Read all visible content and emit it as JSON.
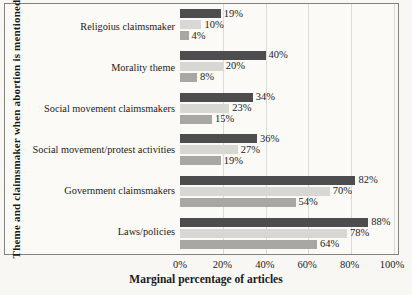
{
  "figure": {
    "background": "#f9f7f3",
    "plot_background": "#fbfaf7",
    "border_color": "#83827f",
    "gridline_color": "#dbdbd8",
    "text_color": "#1b1b1b"
  },
  "chart_data": {
    "type": "bar",
    "orientation": "horizontal",
    "title": "",
    "xlabel": "Marginal percentage of articles",
    "ylabel": "Theme and claimsmaker when abortion is mentioned",
    "xlim": [
      0,
      100
    ],
    "xticks": [
      "0%",
      "20%",
      "40%",
      "60%",
      "80%",
      "100%"
    ],
    "grid": "vertical-only",
    "legend": "none",
    "data_labels": "outside-end",
    "categories": [
      "Religoius claimsmaker",
      "Morality theme",
      "Social movement claimsmakers",
      "Social movement/protest activities",
      "Government claimsmakers",
      "Laws/policies"
    ],
    "series": [
      {
        "name": "dark-gray",
        "color": "#4d4d4f",
        "values": [
          19,
          40,
          34,
          36,
          82,
          88
        ],
        "labels": [
          "19%",
          "40%",
          "34%",
          "36%",
          "82%",
          "88%"
        ]
      },
      {
        "name": "light-gray",
        "color": "#d8d7d3",
        "values": [
          10,
          20,
          23,
          27,
          70,
          78
        ],
        "labels": [
          "10%",
          "20%",
          "23%",
          "27%",
          "70%",
          "78%"
        ]
      },
      {
        "name": "medium-gray",
        "color": "#a8a7a4",
        "values": [
          4,
          8,
          15,
          19,
          54,
          64
        ],
        "labels": [
          "4%",
          "8%",
          "15%",
          "19%",
          "54%",
          "64%"
        ]
      }
    ]
  }
}
